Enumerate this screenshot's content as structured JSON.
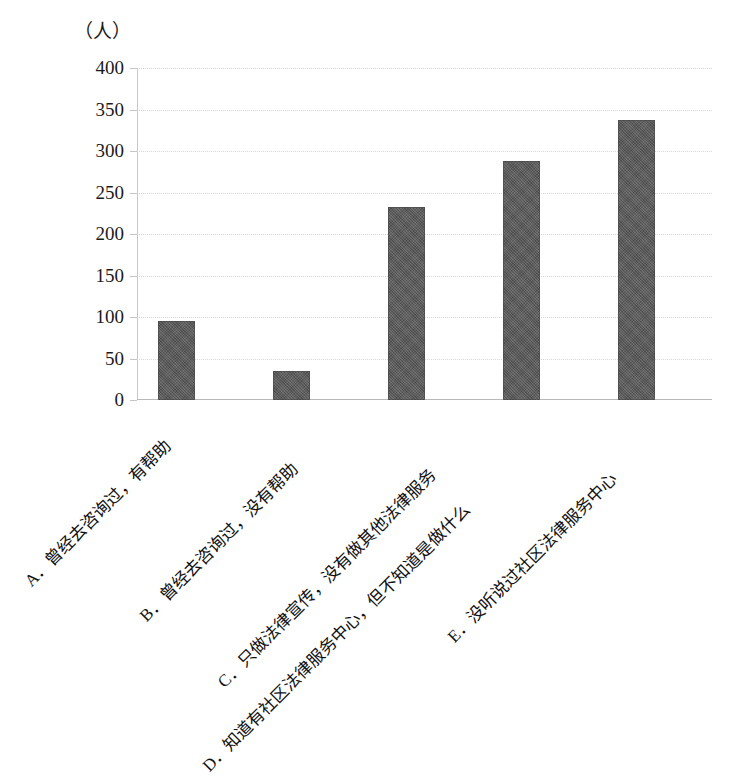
{
  "chart_data": {
    "type": "bar",
    "title": "",
    "subtitle": "",
    "unit_label": "（人）",
    "xlabel": "",
    "ylabel": "",
    "ylim": [
      0,
      400
    ],
    "ytick_step": 50,
    "yticks": [
      "400",
      "350",
      "300",
      "250",
      "200",
      "150",
      "100",
      "50",
      "0"
    ],
    "grid": true,
    "legend": false,
    "legend_position": "none",
    "bar_color": "#575757",
    "categories": [
      "A．曾经去咨询过，有帮助",
      "B．曾经去咨询过，没有帮助",
      "C．只做法律宣传，没有做其他法律服务",
      "D．知道有社区法律服务中心，但不知道是做什么",
      "E．没听说过社区法律服务中心"
    ],
    "category_keys": [
      "A",
      "B",
      "C",
      "D",
      "E"
    ],
    "values": [
      95,
      35,
      232,
      288,
      337
    ]
  },
  "colors": {
    "bar": "#575757",
    "gridline": "#d7d7d7",
    "axis": "#c0c0c0",
    "text": "#1b1b1b",
    "background": "#ffffff"
  },
  "scan_caption": ""
}
